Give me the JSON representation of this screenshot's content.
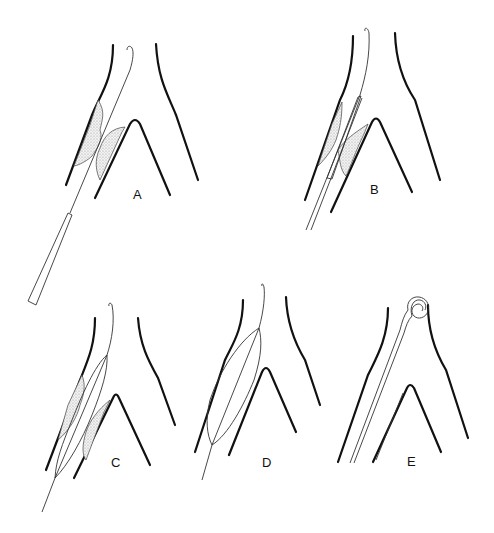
{
  "figure": {
    "panels": [
      {
        "id": "A",
        "label": "A",
        "description": "Guidewire passed through stenosis with plaque deposits; balloon catheter approaching"
      },
      {
        "id": "B",
        "label": "B",
        "description": "Deflated balloon catheter positioned across the stenosis"
      },
      {
        "id": "C",
        "label": "C",
        "description": "Balloon partially inflated, compressing plaque"
      },
      {
        "id": "D",
        "label": "D",
        "description": "Balloon fully inflated, vessel lumen widened"
      },
      {
        "id": "E",
        "label": "E",
        "description": "Balloon withdrawn; curled guidewire tip remains in widened lumen"
      }
    ]
  },
  "colors": {
    "background": "#ffffff",
    "line": "#111111",
    "plaque_fill": "#d8d8d8"
  }
}
